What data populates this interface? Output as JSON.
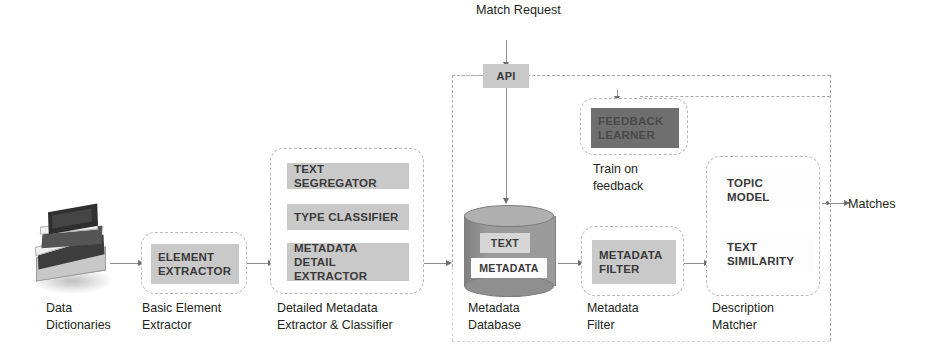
{
  "diagram": {
    "title_annotation": "Match Request",
    "output_label": "Matches",
    "feedback_label": "Train on\nfeedback"
  },
  "colors": {
    "chip_fill": "#c9c9c9",
    "chip_dark_fill": "#6f6f6f",
    "chip_light_fill": "#f4f4f4",
    "dashed_border": "#b9b9b9",
    "connector": "#a9a9a9",
    "cylinder_body": "#9a9a9a",
    "text": "#231f20"
  },
  "stages": [
    {
      "id": "data-dictionaries",
      "caption": "Data\nDictionaries",
      "icon": "book-stack-icon",
      "chips": []
    },
    {
      "id": "basic-element-extractor",
      "caption": "Basic Element\nExtractor",
      "chips": [
        {
          "label": "ELEMENT\nEXTRACTOR",
          "style": "grey"
        }
      ]
    },
    {
      "id": "detailed-metadata-extractor",
      "caption": "Detailed Metadata\nExtractor & Classifier",
      "chips": [
        {
          "label": "TEXT SEGREGATOR",
          "style": "grey"
        },
        {
          "label": "TYPE CLASSIFIER",
          "style": "grey"
        },
        {
          "label": "METADATA DETAIL\nEXTRACTOR",
          "style": "grey"
        }
      ]
    },
    {
      "id": "metadata-database",
      "caption": "Metadata\nDatabase",
      "icon": "database-cylinder-icon",
      "chips": [
        {
          "label": "TEXT",
          "style": "light"
        },
        {
          "label": "METADATA",
          "style": "white"
        }
      ]
    },
    {
      "id": "metadata-filter",
      "caption": "Metadata\nFilter",
      "chips": [
        {
          "label": "METADATA\nFILTER",
          "style": "grey"
        }
      ]
    },
    {
      "id": "description-matcher",
      "caption": "Description\nMatcher",
      "chips": [
        {
          "label": "TOPIC\nMODEL",
          "style": "white"
        },
        {
          "label": "TEXT\nSIMILARITY",
          "style": "white"
        }
      ]
    },
    {
      "id": "feedback-learner",
      "caption": "Train on\nfeedback",
      "chips": [
        {
          "label": "FEEDBACK\nLEARNER",
          "style": "dark"
        }
      ]
    },
    {
      "id": "api",
      "caption": "",
      "chips": [
        {
          "label": "API",
          "style": "grey"
        }
      ]
    }
  ]
}
